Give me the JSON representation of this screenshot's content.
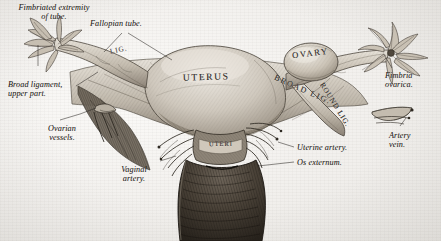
{
  "figure": {
    "style": "vintage steel-engraving anatomical plate",
    "background_color": "#f4f3f1",
    "ink_color": "#2a2724"
  },
  "labels": {
    "fimbriated_extremity": "Fimbriated extremity\nof tube.",
    "fallopian_tube": "Fallopian tube.",
    "broad_ligament_upper": "Broad ligament,\nupper part.",
    "ovarian_vessels": "Ovarian\nvessels.",
    "vaginal_artery": "Vaginal\nartery.",
    "fimbria_ovarica": "Fimbria\novarica.",
    "artery_vein": "Artery\nvein.",
    "uterine_artery": "Uterine artery.",
    "os_externum": "Os externum."
  },
  "organ_captions": {
    "uterus": "UTERUS",
    "ovary": "OVARY",
    "broad_lig": "BROAD LIG.",
    "round_lig": "ROUND LIG.",
    "left_lig": "LIG.",
    "cervix_uteri": "UTERI"
  },
  "structures": [
    {
      "name": "uterus-body",
      "caption": "UTERUS"
    },
    {
      "name": "left-fallopian-tube",
      "caption": "Fallopian tube."
    },
    {
      "name": "right-fallopian-tube",
      "caption": "Fallopian tube."
    },
    {
      "name": "left-fimbriae",
      "caption": "Fimbriated extremity of tube."
    },
    {
      "name": "right-fimbriae",
      "caption": "Fimbria ovarica."
    },
    {
      "name": "ovary",
      "caption": "OVARY"
    },
    {
      "name": "broad-ligament",
      "caption": "BROAD LIG."
    },
    {
      "name": "round-ligament",
      "caption": "ROUND LIG."
    },
    {
      "name": "cervix",
      "caption": "UTERI"
    },
    {
      "name": "vagina",
      "caption": "Os externum."
    },
    {
      "name": "uterine-artery",
      "caption": "Uterine artery."
    },
    {
      "name": "vaginal-artery",
      "caption": "Vaginal artery."
    },
    {
      "name": "ovarian-vessels",
      "caption": "Ovarian vessels."
    }
  ]
}
